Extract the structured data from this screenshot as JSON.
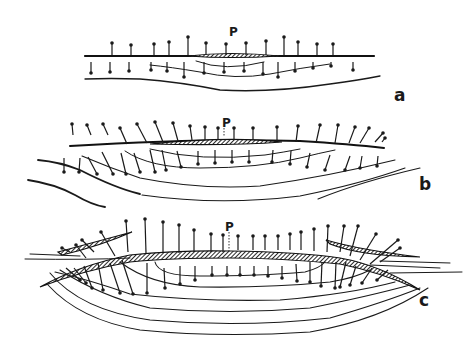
{
  "figure": {
    "panels": [
      {
        "id": "a",
        "label": "a",
        "point_label": "P",
        "up_arrows": [
          {
            "x": 112,
            "base": 55,
            "tip": 43
          },
          {
            "x": 131,
            "base": 55,
            "tip": 45
          },
          {
            "x": 154,
            "base": 55,
            "tip": 44
          },
          {
            "x": 169,
            "base": 55,
            "tip": 42
          },
          {
            "x": 188,
            "base": 55,
            "tip": 37
          },
          {
            "x": 206,
            "base": 55,
            "tip": 43
          },
          {
            "x": 226,
            "base": 55,
            "tip": 44
          },
          {
            "x": 246,
            "base": 55,
            "tip": 43
          },
          {
            "x": 266,
            "base": 55,
            "tip": 41
          },
          {
            "x": 284,
            "base": 55,
            "tip": 37
          },
          {
            "x": 298,
            "base": 55,
            "tip": 42
          },
          {
            "x": 317,
            "base": 55,
            "tip": 44
          },
          {
            "x": 333,
            "base": 55,
            "tip": 44
          }
        ],
        "down_arrows": [
          {
            "x": 91,
            "base": 62,
            "tip": 73
          },
          {
            "x": 110,
            "base": 62,
            "tip": 72
          },
          {
            "x": 129,
            "base": 62,
            "tip": 71
          },
          {
            "x": 151,
            "base": 62,
            "tip": 70
          },
          {
            "x": 167,
            "base": 62,
            "tip": 71
          },
          {
            "x": 184,
            "base": 62,
            "tip": 77
          },
          {
            "x": 204,
            "base": 62,
            "tip": 73
          },
          {
            "x": 224,
            "base": 62,
            "tip": 72
          },
          {
            "x": 244,
            "base": 62,
            "tip": 71
          },
          {
            "x": 263,
            "base": 62,
            "tip": 74
          },
          {
            "x": 278,
            "base": 62,
            "tip": 77
          },
          {
            "x": 295,
            "base": 62,
            "tip": 71
          },
          {
            "x": 313,
            "base": 62,
            "tip": 68
          },
          {
            "x": 331,
            "base": 62,
            "tip": 66
          },
          {
            "x": 353,
            "base": 62,
            "tip": 70
          }
        ]
      },
      {
        "id": "b",
        "label": "b",
        "point_label": "P",
        "up_arrows": [
          {
            "x1": 73,
            "y1": 135,
            "x2": 72,
            "y2": 124
          },
          {
            "x1": 91,
            "y1": 135,
            "x2": 87,
            "y2": 125
          },
          {
            "x1": 108,
            "y1": 135,
            "x2": 103,
            "y2": 124
          },
          {
            "x1": 127,
            "y1": 144,
            "x2": 120,
            "y2": 128
          },
          {
            "x1": 147,
            "y1": 143,
            "x2": 137,
            "y2": 124
          },
          {
            "x1": 163,
            "y1": 142,
            "x2": 155,
            "y2": 122
          },
          {
            "x1": 178,
            "y1": 141,
            "x2": 173,
            "y2": 123
          },
          {
            "x1": 192,
            "y1": 140,
            "x2": 190,
            "y2": 126
          },
          {
            "x1": 205,
            "y1": 140,
            "x2": 205,
            "y2": 127
          },
          {
            "x1": 218,
            "y1": 140,
            "x2": 218,
            "y2": 128
          },
          {
            "x1": 234,
            "y1": 140,
            "x2": 234,
            "y2": 128
          },
          {
            "x1": 253,
            "y1": 140,
            "x2": 253,
            "y2": 128
          },
          {
            "x1": 277,
            "y1": 141,
            "x2": 277,
            "y2": 127
          },
          {
            "x1": 296,
            "y1": 142,
            "x2": 298,
            "y2": 126
          },
          {
            "x1": 316,
            "y1": 143,
            "x2": 320,
            "y2": 125
          },
          {
            "x1": 335,
            "y1": 143,
            "x2": 338,
            "y2": 125
          },
          {
            "x1": 349,
            "y1": 143,
            "x2": 355,
            "y2": 127
          },
          {
            "x1": 360,
            "y1": 143,
            "x2": 369,
            "y2": 128
          },
          {
            "x1": 375,
            "y1": 142,
            "x2": 383,
            "y2": 133
          },
          {
            "x1": 382,
            "y1": 142,
            "x2": 385,
            "y2": 138
          }
        ],
        "down_arrows": [
          {
            "x1": 64,
            "y1": 158,
            "x2": 64,
            "y2": 172
          },
          {
            "x1": 80,
            "y1": 158,
            "x2": 79,
            "y2": 172
          },
          {
            "x1": 88,
            "y1": 157,
            "x2": 97,
            "y2": 174
          },
          {
            "x1": 102,
            "y1": 152,
            "x2": 113,
            "y2": 174
          },
          {
            "x1": 121,
            "y1": 153,
            "x2": 126,
            "y2": 174
          },
          {
            "x1": 134,
            "y1": 153,
            "x2": 140,
            "y2": 172
          },
          {
            "x1": 150,
            "y1": 150,
            "x2": 155,
            "y2": 172
          },
          {
            "x1": 162,
            "y1": 150,
            "x2": 166,
            "y2": 170
          },
          {
            "x1": 177,
            "y1": 151,
            "x2": 181,
            "y2": 167
          },
          {
            "x1": 198,
            "y1": 151,
            "x2": 198,
            "y2": 164
          },
          {
            "x1": 215,
            "y1": 150,
            "x2": 215,
            "y2": 163
          },
          {
            "x1": 232,
            "y1": 150,
            "x2": 232,
            "y2": 162
          },
          {
            "x1": 249,
            "y1": 150,
            "x2": 249,
            "y2": 162
          },
          {
            "x1": 273,
            "y1": 150,
            "x2": 272,
            "y2": 162
          },
          {
            "x1": 291,
            "y1": 151,
            "x2": 290,
            "y2": 164
          },
          {
            "x1": 310,
            "y1": 153,
            "x2": 307,
            "y2": 167
          },
          {
            "x1": 330,
            "y1": 155,
            "x2": 325,
            "y2": 170
          },
          {
            "x1": 350,
            "y1": 156,
            "x2": 345,
            "y2": 170
          },
          {
            "x1": 362,
            "y1": 156,
            "x2": 360,
            "y2": 168
          },
          {
            "x1": 378,
            "y1": 156,
            "x2": 377,
            "y2": 166
          }
        ]
      },
      {
        "id": "c",
        "label": "c",
        "point_label": "P",
        "up_arrows": [
          {
            "x1": 128,
            "y1": 252,
            "x2": 126,
            "y2": 221
          },
          {
            "x1": 146,
            "y1": 253,
            "x2": 145,
            "y2": 219
          },
          {
            "x1": 163,
            "y1": 252,
            "x2": 163,
            "y2": 222
          },
          {
            "x1": 179,
            "y1": 253,
            "x2": 179,
            "y2": 225
          },
          {
            "x1": 194,
            "y1": 252,
            "x2": 194,
            "y2": 230
          },
          {
            "x1": 211,
            "y1": 252,
            "x2": 211,
            "y2": 234
          },
          {
            "x1": 223,
            "y1": 252,
            "x2": 223,
            "y2": 235
          },
          {
            "x1": 238,
            "y1": 250,
            "x2": 238,
            "y2": 236
          },
          {
            "x1": 253,
            "y1": 250,
            "x2": 253,
            "y2": 236
          },
          {
            "x1": 265,
            "y1": 250,
            "x2": 265,
            "y2": 236
          },
          {
            "x1": 278,
            "y1": 250,
            "x2": 278,
            "y2": 236
          },
          {
            "x1": 290,
            "y1": 250,
            "x2": 290,
            "y2": 234
          },
          {
            "x1": 301,
            "y1": 250,
            "x2": 301,
            "y2": 232
          },
          {
            "x1": 314,
            "y1": 251,
            "x2": 314,
            "y2": 229
          },
          {
            "x1": 327,
            "y1": 252,
            "x2": 328,
            "y2": 226
          },
          {
            "x1": 340,
            "y1": 252,
            "x2": 344,
            "y2": 226
          },
          {
            "x1": 350,
            "y1": 256,
            "x2": 358,
            "y2": 226
          },
          {
            "x1": 360,
            "y1": 260,
            "x2": 376,
            "y2": 234
          },
          {
            "x1": 370,
            "y1": 264,
            "x2": 398,
            "y2": 240
          },
          {
            "x1": 380,
            "y1": 262,
            "x2": 400,
            "y2": 248
          },
          {
            "x1": 115,
            "y1": 256,
            "x2": 101,
            "y2": 232
          },
          {
            "x1": 94,
            "y1": 252,
            "x2": 82,
            "y2": 240
          },
          {
            "x1": 86,
            "y1": 258,
            "x2": 76,
            "y2": 245
          },
          {
            "x1": 70,
            "y1": 252,
            "x2": 62,
            "y2": 248
          }
        ],
        "down_arrows": [
          {
            "x1": 147,
            "y1": 263,
            "x2": 147,
            "y2": 293
          },
          {
            "x1": 164,
            "y1": 268,
            "x2": 165,
            "y2": 288
          },
          {
            "x1": 180,
            "y1": 266,
            "x2": 180,
            "y2": 284
          },
          {
            "x1": 195,
            "y1": 266,
            "x2": 195,
            "y2": 280
          },
          {
            "x1": 212,
            "y1": 266,
            "x2": 212,
            "y2": 275
          },
          {
            "x1": 227,
            "y1": 266,
            "x2": 227,
            "y2": 275
          },
          {
            "x1": 240,
            "y1": 266,
            "x2": 240,
            "y2": 275
          },
          {
            "x1": 254,
            "y1": 266,
            "x2": 254,
            "y2": 275
          },
          {
            "x1": 268,
            "y1": 266,
            "x2": 268,
            "y2": 276
          },
          {
            "x1": 282,
            "y1": 266,
            "x2": 282,
            "y2": 278
          },
          {
            "x1": 296,
            "y1": 264,
            "x2": 297,
            "y2": 281
          },
          {
            "x1": 310,
            "y1": 262,
            "x2": 310,
            "y2": 282
          },
          {
            "x1": 322,
            "y1": 262,
            "x2": 321,
            "y2": 286
          },
          {
            "x1": 336,
            "y1": 262,
            "x2": 335,
            "y2": 288
          },
          {
            "x1": 346,
            "y1": 262,
            "x2": 340,
            "y2": 287
          },
          {
            "x1": 356,
            "y1": 266,
            "x2": 350,
            "y2": 285
          },
          {
            "x1": 372,
            "y1": 268,
            "x2": 362,
            "y2": 283
          },
          {
            "x1": 388,
            "y1": 270,
            "x2": 377,
            "y2": 280
          },
          {
            "x1": 122,
            "y1": 260,
            "x2": 133,
            "y2": 294
          },
          {
            "x1": 110,
            "y1": 263,
            "x2": 120,
            "y2": 293
          },
          {
            "x1": 98,
            "y1": 263,
            "x2": 103,
            "y2": 290
          },
          {
            "x1": 84,
            "y1": 266,
            "x2": 92,
            "y2": 288
          },
          {
            "x1": 74,
            "y1": 268,
            "x2": 86,
            "y2": 283
          },
          {
            "x1": 66,
            "y1": 268,
            "x2": 80,
            "y2": 280
          }
        ]
      }
    ]
  }
}
